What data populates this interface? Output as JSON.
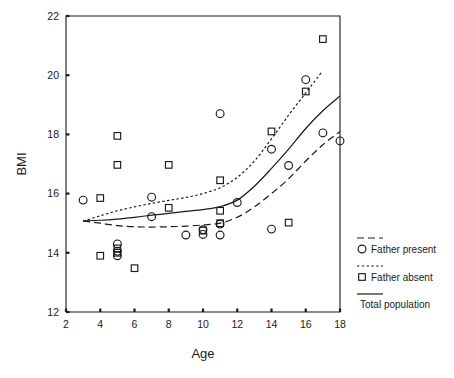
{
  "chart_data": {
    "type": "scatter",
    "title": "",
    "xlabel": "Age",
    "ylabel": "BMI",
    "xlim": [
      2,
      18
    ],
    "ylim": [
      12,
      22
    ],
    "xticks": [
      2,
      4,
      6,
      8,
      10,
      12,
      14,
      16,
      18
    ],
    "yticks": [
      12,
      14,
      16,
      18,
      20,
      22
    ],
    "xtick_labels": [
      "2",
      "4",
      "6",
      "8",
      "10",
      "12",
      "14",
      "16",
      "18"
    ],
    "ytick_labels": [
      "12",
      "14",
      "16",
      "18",
      "20",
      "22"
    ],
    "grid": false,
    "legend_position": "right",
    "series": [
      {
        "name": "Father present",
        "marker": "circle",
        "line_style": "dashed",
        "points": [
          {
            "x": 3,
            "y": 15.78
          },
          {
            "x": 5,
            "y": 14.3
          },
          {
            "x": 5,
            "y": 14.05
          },
          {
            "x": 5,
            "y": 13.9
          },
          {
            "x": 7,
            "y": 15.88
          },
          {
            "x": 7,
            "y": 15.22
          },
          {
            "x": 9,
            "y": 14.6
          },
          {
            "x": 10,
            "y": 14.78
          },
          {
            "x": 10,
            "y": 14.62
          },
          {
            "x": 11,
            "y": 18.7
          },
          {
            "x": 11,
            "y": 14.97
          },
          {
            "x": 11,
            "y": 14.6
          },
          {
            "x": 12,
            "y": 15.7
          },
          {
            "x": 14,
            "y": 17.5
          },
          {
            "x": 14,
            "y": 14.8
          },
          {
            "x": 15,
            "y": 16.95
          },
          {
            "x": 16,
            "y": 19.85
          },
          {
            "x": 17,
            "y": 18.05
          },
          {
            "x": 18,
            "y": 17.78
          }
        ],
        "curve": [
          {
            "x": 3,
            "y": 15.08
          },
          {
            "x": 4,
            "y": 15.0
          },
          {
            "x": 5,
            "y": 14.92
          },
          {
            "x": 6,
            "y": 14.88
          },
          {
            "x": 7,
            "y": 14.87
          },
          {
            "x": 8,
            "y": 14.88
          },
          {
            "x": 9,
            "y": 14.9
          },
          {
            "x": 10,
            "y": 14.94
          },
          {
            "x": 11,
            "y": 15.0
          },
          {
            "x": 12,
            "y": 15.2
          },
          {
            "x": 13,
            "y": 15.55
          },
          {
            "x": 14,
            "y": 16.0
          },
          {
            "x": 15,
            "y": 16.5
          },
          {
            "x": 16,
            "y": 17.1
          },
          {
            "x": 17,
            "y": 17.65
          },
          {
            "x": 18,
            "y": 18.1
          }
        ]
      },
      {
        "name": "Father absent",
        "marker": "square",
        "line_style": "dotted",
        "points": [
          {
            "x": 4,
            "y": 15.85
          },
          {
            "x": 4,
            "y": 13.9
          },
          {
            "x": 5,
            "y": 17.95
          },
          {
            "x": 5,
            "y": 16.97
          },
          {
            "x": 5,
            "y": 14.15
          },
          {
            "x": 5,
            "y": 14.0
          },
          {
            "x": 6,
            "y": 13.48
          },
          {
            "x": 8,
            "y": 16.97
          },
          {
            "x": 8,
            "y": 15.52
          },
          {
            "x": 10,
            "y": 14.75
          },
          {
            "x": 11,
            "y": 16.45
          },
          {
            "x": 11,
            "y": 15.42
          },
          {
            "x": 11,
            "y": 15.0
          },
          {
            "x": 14,
            "y": 18.1
          },
          {
            "x": 15,
            "y": 15.02
          },
          {
            "x": 16,
            "y": 19.45
          },
          {
            "x": 17,
            "y": 21.22
          }
        ],
        "curve": [
          {
            "x": 3,
            "y": 15.07
          },
          {
            "x": 4,
            "y": 15.25
          },
          {
            "x": 5,
            "y": 15.42
          },
          {
            "x": 6,
            "y": 15.55
          },
          {
            "x": 7,
            "y": 15.67
          },
          {
            "x": 8,
            "y": 15.77
          },
          {
            "x": 9,
            "y": 15.87
          },
          {
            "x": 10,
            "y": 16.0
          },
          {
            "x": 11,
            "y": 16.2
          },
          {
            "x": 12,
            "y": 16.55
          },
          {
            "x": 13,
            "y": 17.1
          },
          {
            "x": 14,
            "y": 17.85
          },
          {
            "x": 15,
            "y": 18.65
          },
          {
            "x": 16,
            "y": 19.4
          },
          {
            "x": 16.95,
            "y": 20.12
          }
        ]
      },
      {
        "name": "Total population",
        "marker": "none",
        "line_style": "solid",
        "points": [],
        "curve": [
          {
            "x": 3,
            "y": 15.08
          },
          {
            "x": 4,
            "y": 15.1
          },
          {
            "x": 5,
            "y": 15.14
          },
          {
            "x": 6,
            "y": 15.2
          },
          {
            "x": 7,
            "y": 15.27
          },
          {
            "x": 8,
            "y": 15.33
          },
          {
            "x": 9,
            "y": 15.4
          },
          {
            "x": 10,
            "y": 15.46
          },
          {
            "x": 11,
            "y": 15.56
          },
          {
            "x": 12,
            "y": 15.78
          },
          {
            "x": 13,
            "y": 16.25
          },
          {
            "x": 14,
            "y": 16.85
          },
          {
            "x": 15,
            "y": 17.5
          },
          {
            "x": 16,
            "y": 18.2
          },
          {
            "x": 17,
            "y": 18.8
          },
          {
            "x": 18,
            "y": 19.3
          }
        ]
      }
    ]
  },
  "axes": {
    "x_title": "Age",
    "y_title": "BMI"
  },
  "legend": {
    "items": [
      {
        "label": "Father present",
        "marker": "circle",
        "line": "dashed"
      },
      {
        "label": "Father absent",
        "marker": "square",
        "line": "dotted"
      },
      {
        "label": "Total population",
        "marker": "none",
        "line": "solid"
      }
    ]
  }
}
